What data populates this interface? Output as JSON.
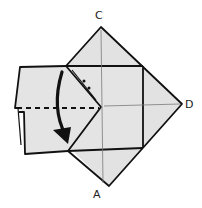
{
  "diagram": {
    "type": "origami-fold-step",
    "labels": {
      "top": "C",
      "right": "D",
      "bottom": "A"
    },
    "colors": {
      "paper": "#e2e2e2",
      "line": "#111111",
      "crease": "#7a7a7a",
      "background": "#ffffff"
    },
    "annotations": {
      "fold_arrow": "valley fold downward",
      "dashed_line": "valley fold line",
      "dots": "pleat marks"
    }
  }
}
